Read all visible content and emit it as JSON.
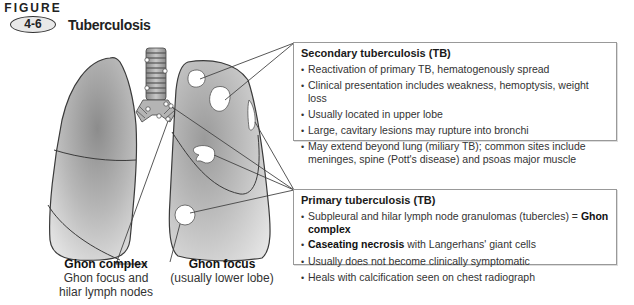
{
  "figure": {
    "word": "FIGURE",
    "number": "4-6",
    "title": "Tuberculosis"
  },
  "secondary": {
    "heading": "Secondary tuberculosis (TB)",
    "items": [
      "Reactivation of primary TB, hematogenously spread",
      "Clinical presentation includes weakness, hemoptysis, weight loss",
      "Usually located in upper lobe",
      "Large, cavitary lesions may rupture into bronchi",
      "May extend beyond lung (miliary TB); common sites include meninges, spine (Pott's disease) and psoas major muscle"
    ]
  },
  "primary": {
    "heading": "Primary tuberculosis (TB)",
    "items": [
      {
        "pre": "Subpleural and hilar lymph node granulomas (tubercles) = ",
        "bold": "Ghon complex",
        "post": ""
      },
      {
        "pre": "",
        "bold": "Caseating necrosis",
        "post": " with Langerhans' giant cells"
      },
      {
        "pre": "Usually does not become clinically symptomatic",
        "bold": "",
        "post": ""
      },
      {
        "pre": "Heals with calcification seen on chest radiograph",
        "bold": "",
        "post": ""
      }
    ]
  },
  "captions": {
    "ghon_complex": {
      "title": "Ghon complex",
      "line1": "Ghon focus and",
      "line2": "hilar lymph nodes"
    },
    "ghon_focus": {
      "title": "Ghon focus",
      "line1": "(usually lower lobe)"
    }
  },
  "colors": {
    "lung_dark": "#8a8a8a",
    "lung_light": "#e0e0e0",
    "outline": "#3a3a3a",
    "box_border": "#999999"
  }
}
